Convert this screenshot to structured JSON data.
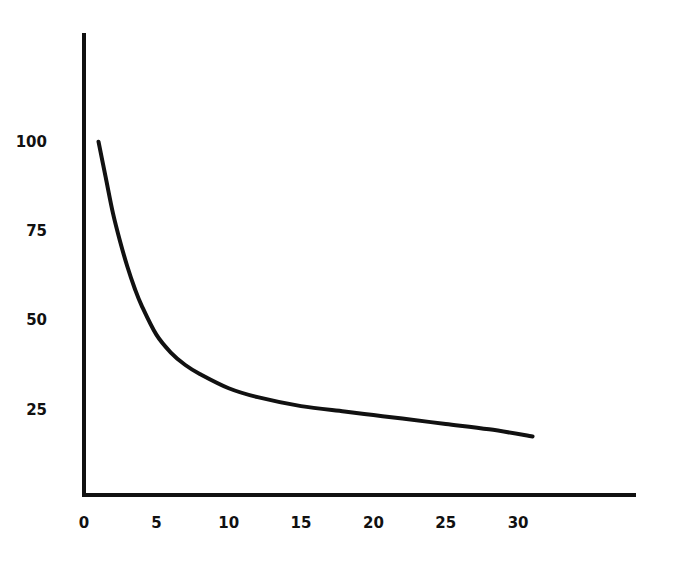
{
  "chart_data": {
    "type": "line",
    "title": "",
    "xlabel": "",
    "ylabel": "",
    "xlim": [
      0,
      38
    ],
    "ylim": [
      0,
      125
    ],
    "grid": false,
    "legend": null,
    "x_ticks": [
      "0",
      "5",
      "10",
      "15",
      "20",
      "25",
      "30"
    ],
    "y_ticks": [
      "25",
      "50",
      "75",
      "100"
    ],
    "series": [
      {
        "name": "curve",
        "color": "#111111",
        "x": [
          1,
          1.5,
          2,
          2.5,
          3,
          3.5,
          4,
          5,
          6,
          7,
          8,
          10,
          12,
          15,
          18,
          20,
          22,
          25,
          28,
          31
        ],
        "y": [
          100,
          90,
          80,
          72,
          65,
          59,
          54,
          46,
          41,
          37.5,
          35,
          31,
          28.5,
          26,
          24.5,
          23.5,
          22.5,
          21,
          19.5,
          17.5
        ]
      }
    ]
  }
}
